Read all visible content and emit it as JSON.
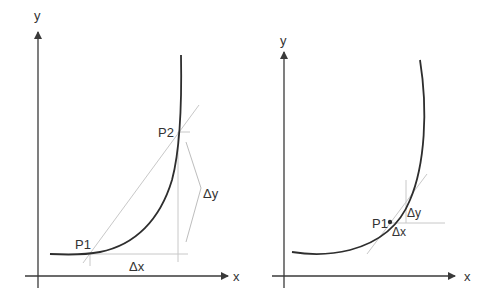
{
  "diagrams": [
    {
      "id": "secant",
      "axis_labels": {
        "x": "x",
        "y": "y"
      },
      "points": {
        "p1": "P1",
        "p2": "P2"
      },
      "deltas": {
        "dx": "Δx",
        "dy": "Δy"
      },
      "colors": {
        "axis": "#3a3a3a",
        "curve": "#2e2e2e",
        "guide": "#c8c8c8"
      }
    },
    {
      "id": "tangent",
      "axis_labels": {
        "x": "x",
        "y": "y"
      },
      "points": {
        "p1": "P1"
      },
      "deltas": {
        "dx": "Δx",
        "dy": "Δy"
      },
      "colors": {
        "axis": "#3a3a3a",
        "curve": "#2e2e2e",
        "guide": "#c8c8c8"
      }
    }
  ]
}
